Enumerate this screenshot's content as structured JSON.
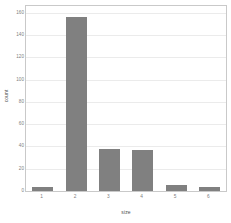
{
  "chart_data": {
    "type": "bar",
    "title": "",
    "subtitle": "",
    "xlabel": "size",
    "ylabel": "count",
    "categories": [
      "1",
      "2",
      "3",
      "4",
      "5",
      "6"
    ],
    "values": [
      4,
      156,
      38,
      37,
      5,
      4
    ],
    "yticks": [
      0,
      20,
      40,
      60,
      80,
      100,
      120,
      140,
      160
    ],
    "ytick_labels": [
      "0",
      "20",
      "40",
      "60",
      "80",
      "100",
      "120",
      "140",
      "160"
    ],
    "ylim": [
      0,
      166
    ],
    "xlim_categories": 6,
    "grid": true,
    "grid_axis": "y",
    "legend": null,
    "legend_position": "none",
    "bar_color": "#808080",
    "panel_background": "#ffffff",
    "gridline_color": "#ebebeb",
    "panel_border_color": "#c9c9c9",
    "axis_text_color": "#808080",
    "axis_title_color": "#4d4d4d"
  }
}
